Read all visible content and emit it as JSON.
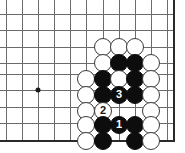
{
  "diagram": {
    "type": "go-board-problem",
    "board": {
      "width_px": 185,
      "height_px": 153,
      "background_color": "#ffffff",
      "line_color": "#6b6b6b",
      "edge_color": "#2a2a2a",
      "cell_size_px": 16.2,
      "origin_x_px": 6,
      "origin_y_px": 14,
      "columns": 11,
      "rows": 9,
      "column_x_px": [
        6,
        22,
        38,
        54,
        70,
        86,
        103,
        119,
        135,
        151,
        167
      ],
      "row_y_px": [
        14,
        30,
        47,
        63,
        74,
        90,
        107,
        123,
        140
      ],
      "right_edge_x_px": 173,
      "bottom_edge_y_px": 140,
      "top_clipped": true,
      "left_clipped": true
    },
    "star_points": [
      {
        "name": "hoshi-left",
        "x_px": 38,
        "y_px": 90
      }
    ],
    "stone_radius_px": 9,
    "stones": [
      {
        "id": "w-c6-r1",
        "color": "white",
        "x_px": 103,
        "y_px": 47,
        "label": ""
      },
      {
        "id": "w-c7-r1",
        "color": "white",
        "x_px": 119,
        "y_px": 47,
        "label": ""
      },
      {
        "id": "w-c8-r1",
        "color": "white",
        "x_px": 135,
        "y_px": 47,
        "label": ""
      },
      {
        "id": "w-c6-r2",
        "color": "white",
        "x_px": 103,
        "y_px": 63,
        "label": ""
      },
      {
        "id": "b-c7-r2",
        "color": "black",
        "x_px": 119,
        "y_px": 63,
        "label": ""
      },
      {
        "id": "b-c8-r2",
        "color": "black",
        "x_px": 135,
        "y_px": 63,
        "label": ""
      },
      {
        "id": "w-c9-r2",
        "color": "white",
        "x_px": 151,
        "y_px": 63,
        "label": ""
      },
      {
        "id": "w-c5-r3",
        "color": "white",
        "x_px": 86,
        "y_px": 79,
        "label": ""
      },
      {
        "id": "b-c6-r3",
        "color": "black",
        "x_px": 103,
        "y_px": 79,
        "label": ""
      },
      {
        "id": "w-c7-r3",
        "color": "white",
        "x_px": 119,
        "y_px": 79,
        "label": ""
      },
      {
        "id": "b-c8-r3",
        "color": "black",
        "x_px": 135,
        "y_px": 79,
        "label": ""
      },
      {
        "id": "w-c9-r3",
        "color": "white",
        "x_px": 151,
        "y_px": 79,
        "label": ""
      },
      {
        "id": "w-c5-r4",
        "color": "white",
        "x_px": 86,
        "y_px": 95,
        "label": ""
      },
      {
        "id": "b-c6-r4",
        "color": "black",
        "x_px": 103,
        "y_px": 95,
        "label": ""
      },
      {
        "id": "b-c7-r4-move3",
        "color": "black",
        "x_px": 119,
        "y_px": 95,
        "label": "3"
      },
      {
        "id": "b-c8-r4",
        "color": "black",
        "x_px": 135,
        "y_px": 95,
        "label": ""
      },
      {
        "id": "w-c9-r4",
        "color": "white",
        "x_px": 151,
        "y_px": 95,
        "label": ""
      },
      {
        "id": "w-c5-r5",
        "color": "white",
        "x_px": 86,
        "y_px": 111,
        "label": ""
      },
      {
        "id": "w-c6-r5-move2",
        "color": "white",
        "x_px": 103,
        "y_px": 111,
        "label": "2"
      },
      {
        "id": "w-c9-r5",
        "color": "white",
        "x_px": 151,
        "y_px": 111,
        "label": ""
      },
      {
        "id": "w-c5-r6",
        "color": "white",
        "x_px": 86,
        "y_px": 125,
        "label": ""
      },
      {
        "id": "b-c6-r6",
        "color": "black",
        "x_px": 103,
        "y_px": 125,
        "label": ""
      },
      {
        "id": "b-c7-r6-move1",
        "color": "black",
        "x_px": 119,
        "y_px": 125,
        "label": "1"
      },
      {
        "id": "b-c8-r6",
        "color": "black",
        "x_px": 135,
        "y_px": 125,
        "label": ""
      },
      {
        "id": "w-c9-r6",
        "color": "white",
        "x_px": 151,
        "y_px": 125,
        "label": ""
      },
      {
        "id": "w-c5-r7",
        "color": "white",
        "x_px": 86,
        "y_px": 141,
        "label": ""
      },
      {
        "id": "b-c6-r7",
        "color": "black",
        "x_px": 103,
        "y_px": 141,
        "label": ""
      },
      {
        "id": "b-c8-r7",
        "color": "black",
        "x_px": 135,
        "y_px": 141,
        "label": ""
      },
      {
        "id": "w-c9-r7",
        "color": "white",
        "x_px": 151,
        "y_px": 141,
        "label": ""
      }
    ],
    "move_numbers": [
      {
        "number": "1",
        "color": "black"
      },
      {
        "number": "2",
        "color": "white"
      },
      {
        "number": "3",
        "color": "black"
      }
    ]
  }
}
